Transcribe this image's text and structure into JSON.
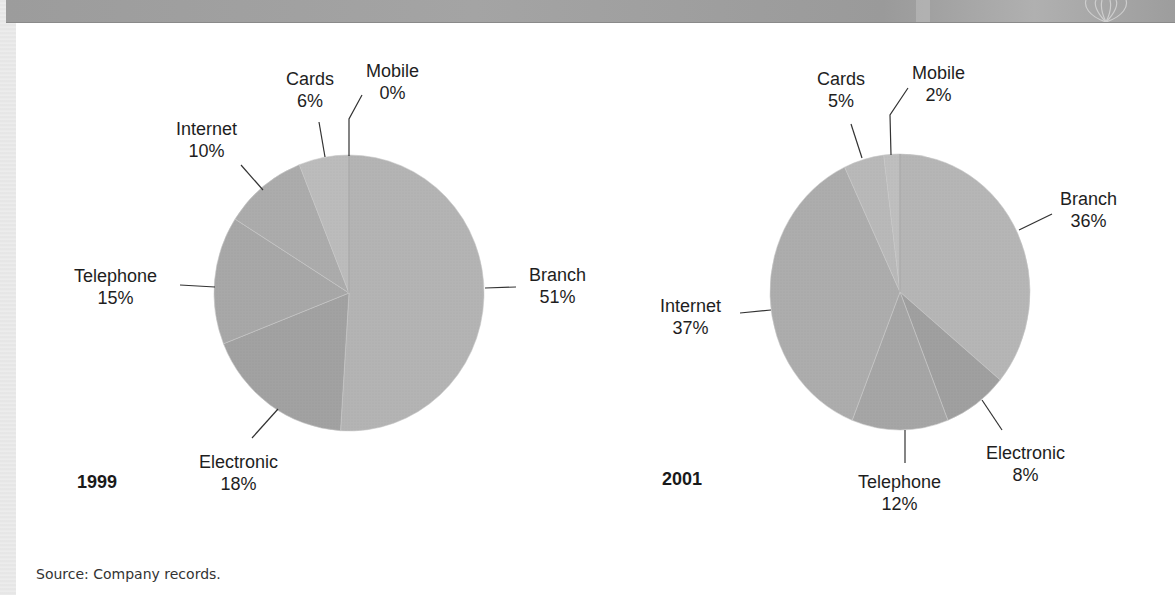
{
  "chart_data": [
    {
      "type": "pie",
      "title": "1999",
      "categories": [
        "Branch",
        "Electronic",
        "Telephone",
        "Internet",
        "Cards",
        "Mobile"
      ],
      "values": [
        51,
        18,
        15,
        10,
        6,
        0
      ],
      "labels": [
        "Branch 51%",
        "Electronic 18%",
        "Telephone 15%",
        "Internet 10%",
        "Cards 6%",
        "Mobile 0%"
      ],
      "start_angle": "12 o'clock, clockwise from Branch",
      "colors": [
        "#b4b4b4",
        "#a2a2a2",
        "#a8a8a8",
        "#acacac",
        "#bcbcbc",
        "#c0c0c0"
      ]
    },
    {
      "type": "pie",
      "title": "2001",
      "categories": [
        "Branch",
        "Electronic",
        "Telephone",
        "Internet",
        "Cards",
        "Mobile"
      ],
      "values": [
        36,
        8,
        12,
        37,
        5,
        2
      ],
      "labels": [
        "Branch 36%",
        "Electronic 8%",
        "Telephone 12%",
        "Internet 37%",
        "Cards 5%",
        "Mobile 2%"
      ],
      "start_angle": "12 o'clock, clockwise from Branch",
      "colors": [
        "#b6b6b6",
        "#a0a0a0",
        "#a6a6a6",
        "#adadad",
        "#b9b9b9",
        "#bfbfbf"
      ]
    }
  ],
  "pie1999": {
    "year": "1999",
    "branch": {
      "name": "Branch",
      "pct": "51%"
    },
    "electronic": {
      "name": "Electronic",
      "pct": "18%"
    },
    "telephone": {
      "name": "Telephone",
      "pct": "15%"
    },
    "internet": {
      "name": "Internet",
      "pct": "10%"
    },
    "cards": {
      "name": "Cards",
      "pct": "6%"
    },
    "mobile": {
      "name": "Mobile",
      "pct": "0%"
    }
  },
  "pie2001": {
    "year": "2001",
    "branch": {
      "name": "Branch",
      "pct": "36%"
    },
    "electronic": {
      "name": "Electronic",
      "pct": "8%"
    },
    "telephone": {
      "name": "Telephone",
      "pct": "12%"
    },
    "internet": {
      "name": "Internet",
      "pct": "37%"
    },
    "cards": {
      "name": "Cards",
      "pct": "5%"
    },
    "mobile": {
      "name": "Mobile",
      "pct": "2%"
    }
  },
  "source": "Source: Company records."
}
